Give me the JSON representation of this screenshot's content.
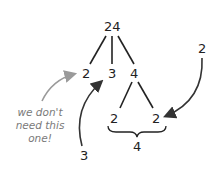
{
  "diagram": {
    "type": "factor-tree",
    "root": "24",
    "level1": [
      "2",
      "3",
      "4"
    ],
    "level2": [
      "2",
      "2"
    ],
    "brace_label": "4",
    "callouts": {
      "right_label": "2",
      "bottom_label": "3",
      "note": "we don't need this one!"
    },
    "note_lines": [
      "we don't",
      "need this",
      "one!"
    ],
    "colors": {
      "ink": "#222222",
      "note": "#7a7a7a",
      "arrow_gray": "#9a9a9a"
    }
  }
}
